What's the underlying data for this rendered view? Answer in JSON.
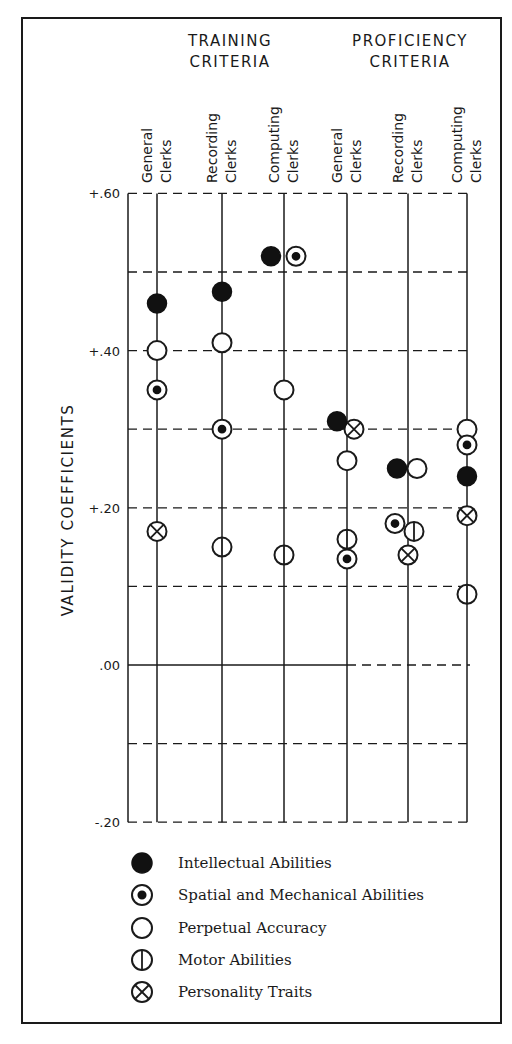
{
  "chart_data": {
    "type": "scatter",
    "title": "",
    "ylabel": "VALIDITY COEFFICIENTS",
    "xlabel": "",
    "ylim": [
      -0.2,
      0.6
    ],
    "yticks": [
      {
        "value": 0.6,
        "label": "+.60"
      },
      {
        "value": 0.4,
        "label": "+.40"
      },
      {
        "value": 0.2,
        "label": "+.20"
      },
      {
        "value": 0.0,
        "label": ".00"
      },
      {
        "value": -0.2,
        "label": "-.20"
      }
    ],
    "gridlines": [
      0.6,
      0.5,
      0.4,
      0.3,
      0.2,
      0.1,
      0.0,
      -0.1,
      -0.2
    ],
    "grid": true,
    "groups": [
      {
        "title_line1": "TRAINING",
        "title_line2": "CRITERIA"
      },
      {
        "title_line1": "PROFICIENCY",
        "title_line2": "CRITERIA"
      }
    ],
    "categories": [
      {
        "group": "TRAINING CRITERIA",
        "line1": "General",
        "line2": "Clerks"
      },
      {
        "group": "TRAINING CRITERIA",
        "line1": "Recording",
        "line2": "Clerks"
      },
      {
        "group": "TRAINING CRITERIA",
        "line1": "Computing",
        "line2": "Clerks"
      },
      {
        "group": "PROFICIENCY CRITERIA",
        "line1": "General",
        "line2": "Clerks"
      },
      {
        "group": "PROFICIENCY CRITERIA",
        "line1": "Recording",
        "line2": "Clerks"
      },
      {
        "group": "PROFICIENCY CRITERIA",
        "line1": "Computing",
        "line2": "Clerks"
      }
    ],
    "series": [
      {
        "name": "Intellectual Abilities",
        "symbol": "filled-circle",
        "values": [
          0.46,
          0.475,
          0.52,
          0.31,
          0.25,
          0.24
        ]
      },
      {
        "name": "Spatial and Mechanical Abilities",
        "symbol": "dotted-circle",
        "values": [
          0.35,
          0.3,
          0.52,
          0.135,
          0.18,
          0.28
        ]
      },
      {
        "name": "Perpetual Accuracy",
        "symbol": "open-circle",
        "values": [
          0.4,
          0.41,
          0.35,
          0.26,
          0.25,
          0.3
        ]
      },
      {
        "name": "Motor Abilities",
        "symbol": "vertical-bar-circle",
        "values": [
          null,
          0.15,
          0.14,
          0.16,
          0.17,
          0.09
        ]
      },
      {
        "name": "Personality Traits",
        "symbol": "x-circle",
        "values": [
          0.17,
          null,
          null,
          0.3,
          0.14,
          0.19
        ]
      }
    ],
    "legend_position": "bottom"
  },
  "legend": {
    "items": [
      {
        "label": "Intellectual Abilities",
        "symbol": "filled-circle"
      },
      {
        "label": "Spatial and Mechanical Abilities",
        "symbol": "dotted-circle"
      },
      {
        "label": "Perpetual Accuracy",
        "symbol": "open-circle"
      },
      {
        "label": "Motor Abilities",
        "symbol": "vertical-bar-circle"
      },
      {
        "label": "Personality Traits",
        "symbol": "x-circle"
      }
    ]
  }
}
